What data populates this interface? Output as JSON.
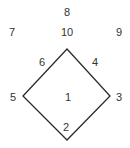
{
  "diagram": {
    "shape": "diamond",
    "stroke_color": "#2b2b2b",
    "text_color": "#333333",
    "vertices": {
      "top": [
        67,
        49
      ],
      "right": [
        110,
        96
      ],
      "bottom": [
        67,
        140
      ],
      "left": [
        23,
        96
      ]
    },
    "labels": [
      {
        "id": "8",
        "text": "8",
        "x": 67,
        "y": 12
      },
      {
        "id": "7",
        "text": "7",
        "x": 12,
        "y": 32
      },
      {
        "id": "10",
        "text": "10",
        "x": 67,
        "y": 32
      },
      {
        "id": "9",
        "text": "9",
        "x": 119,
        "y": 32
      },
      {
        "id": "6",
        "text": "6",
        "x": 42,
        "y": 62
      },
      {
        "id": "4",
        "text": "4",
        "x": 95,
        "y": 62
      },
      {
        "id": "5",
        "text": "5",
        "x": 13,
        "y": 97
      },
      {
        "id": "1",
        "text": "1",
        "x": 68,
        "y": 97
      },
      {
        "id": "3",
        "text": "3",
        "x": 119,
        "y": 97
      },
      {
        "id": "2",
        "text": "2",
        "x": 66,
        "y": 127
      }
    ]
  }
}
